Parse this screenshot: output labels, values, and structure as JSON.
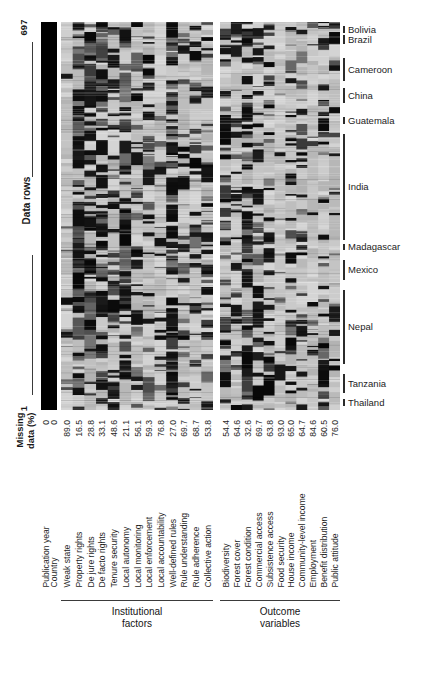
{
  "figure": {
    "type": "heatmap",
    "background": "#ffffff",
    "ink": "#1a1a1a"
  },
  "row_axis": {
    "label": "Data rows",
    "top_value": "697",
    "bottom_value": "1"
  },
  "missing_axis": {
    "title_line1": "Missing",
    "title_line2": "data (%)"
  },
  "columns": [
    {
      "label": "Publication year",
      "missing": "0",
      "group": "id"
    },
    {
      "label": "Country",
      "missing": "0",
      "group": "id"
    },
    {
      "label": "Weak state",
      "missing": "89.0",
      "group": "institutional"
    },
    {
      "label": "Property rights",
      "missing": "16.5",
      "group": "institutional"
    },
    {
      "label": "De jure rights",
      "missing": "28.8",
      "group": "institutional"
    },
    {
      "label": "De facto rights",
      "missing": "33.1",
      "group": "institutional"
    },
    {
      "label": "Tenure security",
      "missing": "48.6",
      "group": "institutional"
    },
    {
      "label": "Local autonomy",
      "missing": "21.1",
      "group": "institutional"
    },
    {
      "label": "Local monitoring",
      "missing": "56.1",
      "group": "institutional"
    },
    {
      "label": "Local enforcement",
      "missing": "59.3",
      "group": "institutional"
    },
    {
      "label": "Local accountability",
      "missing": "76.8",
      "group": "institutional"
    },
    {
      "label": "Well-defined rules",
      "missing": "27.0",
      "group": "institutional"
    },
    {
      "label": "Rule understanding",
      "missing": "69.7",
      "group": "institutional"
    },
    {
      "label": "Rule adherence",
      "missing": "68.7",
      "group": "institutional"
    },
    {
      "label": "Collective action",
      "missing": "53.8",
      "group": "institutional"
    },
    {
      "label": "Biodiversity",
      "missing": "54.4",
      "group": "outcome"
    },
    {
      "label": "Forest cover",
      "missing": "64.6",
      "group": "outcome"
    },
    {
      "label": "Forest condition",
      "missing": "32.6",
      "group": "outcome"
    },
    {
      "label": "Commercial access",
      "missing": "69.7",
      "group": "outcome"
    },
    {
      "label": "Subsistence access",
      "missing": "63.8",
      "group": "outcome"
    },
    {
      "label": "Food security",
      "missing": "93.0",
      "group": "outcome"
    },
    {
      "label": "House income",
      "missing": "65.0",
      "group": "outcome"
    },
    {
      "label": "Community-level income",
      "missing": "64.7",
      "group": "outcome"
    },
    {
      "label": "Employment",
      "missing": "84.6",
      "group": "outcome"
    },
    {
      "label": "Benefit distribution",
      "missing": "60.5",
      "group": "outcome"
    },
    {
      "label": "Public attitude",
      "missing": "76.0",
      "group": "outcome"
    }
  ],
  "countries": [
    {
      "name": "Bolivia",
      "tick_top": 4,
      "tick_height": 7
    },
    {
      "name": "Brazil",
      "tick_top": 13,
      "tick_height": 9
    },
    {
      "name": "Cameroon",
      "tick_top": 36,
      "tick_height": 23
    },
    {
      "name": "China",
      "tick_top": 66,
      "tick_height": 15
    },
    {
      "name": "Guatemala",
      "tick_top": 95,
      "tick_height": 7
    },
    {
      "name": "India",
      "tick_top": 112,
      "tick_height": 106
    },
    {
      "name": "Madagascar",
      "tick_top": 222,
      "tick_height": 6
    },
    {
      "name": "Mexico",
      "tick_top": 238,
      "tick_height": 20
    },
    {
      "name": "Nepal",
      "tick_top": 268,
      "tick_height": 74
    },
    {
      "name": "Tanzania",
      "tick_top": 352,
      "tick_height": 19
    },
    {
      "name": "Thailand",
      "tick_top": 377,
      "tick_height": 7
    }
  ],
  "groups": [
    {
      "line1": "Institutional",
      "line2": "factors",
      "left": 61,
      "width": 152
    },
    {
      "line1": "Outcome",
      "line2": "variables",
      "left": 220,
      "width": 120
    }
  ],
  "chart_data": {
    "type": "heatmap",
    "title": "",
    "xlabel": "",
    "ylabel": "Data rows",
    "n_rows": 697,
    "row_range": [
      1,
      697
    ],
    "grid": false,
    "legend": "none",
    "colormap": "grayscale: black = data present / high, light gray = missing",
    "categories": [
      "Publication year",
      "Country",
      "Weak state",
      "Property rights",
      "De jure rights",
      "De facto rights",
      "Tenure security",
      "Local autonomy",
      "Local monitoring",
      "Local enforcement",
      "Local accountability",
      "Well-defined rules",
      "Rule understanding",
      "Rule adherence",
      "Collective action",
      "Biodiversity",
      "Forest cover",
      "Forest condition",
      "Commercial access",
      "Subsistence access",
      "Food security",
      "House income",
      "Community-level income",
      "Employment",
      "Benefit distribution",
      "Public attitude"
    ],
    "series": [
      {
        "name": "Missing data (%)",
        "values": [
          0,
          0,
          89.0,
          16.5,
          28.8,
          33.1,
          48.6,
          21.1,
          56.1,
          59.3,
          76.8,
          27.0,
          69.7,
          68.7,
          53.8,
          54.4,
          64.6,
          32.6,
          69.7,
          63.8,
          93.0,
          65.0,
          64.7,
          84.6,
          60.5,
          76.0
        ]
      }
    ],
    "row_groups": [
      {
        "name": "Bolivia"
      },
      {
        "name": "Brazil"
      },
      {
        "name": "Cameroon"
      },
      {
        "name": "China"
      },
      {
        "name": "Guatemala"
      },
      {
        "name": "India"
      },
      {
        "name": "Madagascar"
      },
      {
        "name": "Mexico"
      },
      {
        "name": "Nepal"
      },
      {
        "name": "Tanzania"
      },
      {
        "name": "Thailand"
      }
    ],
    "column_groups": [
      "Institutional factors",
      "Outcome variables"
    ]
  }
}
